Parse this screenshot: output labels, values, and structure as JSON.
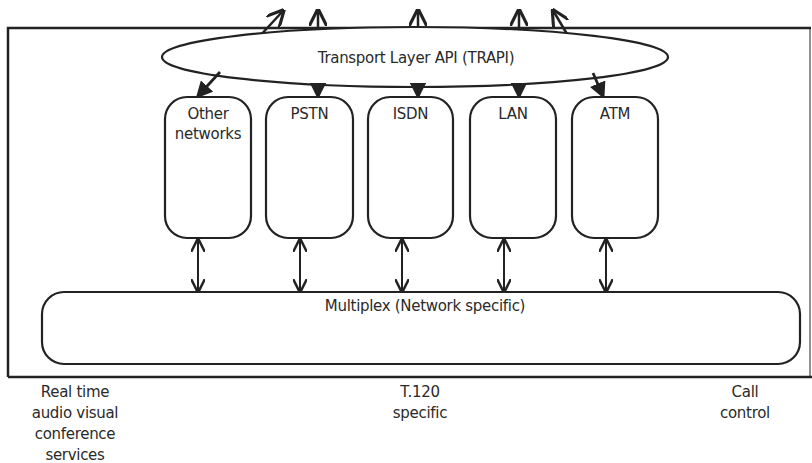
{
  "diagram": {
    "api_layer": {
      "label": "Transport Layer API (TRAPI)"
    },
    "networks": [
      {
        "id": "other",
        "label_line1": "Other",
        "label_line2": "networks"
      },
      {
        "id": "pstn",
        "label_line1": "PSTN",
        "label_line2": ""
      },
      {
        "id": "isdn",
        "label_line1": "ISDN",
        "label_line2": ""
      },
      {
        "id": "lan",
        "label_line1": "LAN",
        "label_line2": ""
      },
      {
        "id": "atm",
        "label_line1": "ATM",
        "label_line2": ""
      }
    ],
    "multiplex": {
      "label": "Multiplex (Network specific)"
    },
    "captions": {
      "left": {
        "lines": [
          "Real time",
          "audio visual",
          "conference",
          "services"
        ]
      },
      "center": {
        "lines": [
          "T.120",
          "specific"
        ]
      },
      "right": {
        "lines": [
          "Call",
          "control"
        ]
      }
    },
    "colors": {
      "stroke": "#222222",
      "background": "#ffffff",
      "text": "#2a2a2a"
    }
  }
}
